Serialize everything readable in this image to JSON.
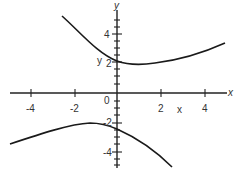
{
  "graph": {
    "axes": {
      "x_label": "x",
      "y_label": "y",
      "origin_label": "0",
      "x_ticks": [
        {
          "value": -4,
          "label": "-4"
        },
        {
          "value": -2,
          "label": "-2"
        },
        {
          "value": 2,
          "label": "2"
        },
        {
          "value": 4,
          "label": "4"
        }
      ],
      "y_ticks": [
        {
          "value": 4,
          "label": "4"
        },
        {
          "value": 2,
          "label": "2"
        },
        {
          "value": -2,
          "label": "-2"
        },
        {
          "value": -4,
          "label": "-4"
        }
      ]
    },
    "annotations": {
      "y_marker": "y",
      "x_marker": "x"
    },
    "curves": [
      {
        "name": "upper-branch",
        "description": "upper hyperbola branch, min near (1, 2)"
      },
      {
        "name": "lower-branch",
        "description": "lower hyperbola branch, max near (-1, -2)"
      }
    ],
    "colors": {
      "line": "#1a1a1a",
      "background": "#ffffff"
    }
  }
}
